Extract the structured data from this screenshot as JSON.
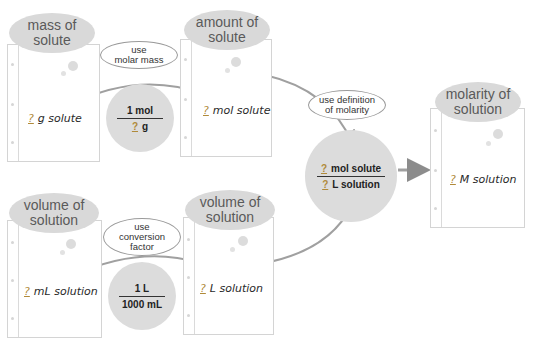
{
  "diagram": {
    "boxes": [
      {
        "id": "mass",
        "label_line1": "mass of",
        "label_line2": "solute",
        "blank": "?",
        "value": "g solute"
      },
      {
        "id": "amount",
        "label_line1": "amount of",
        "label_line2": "solute",
        "blank": "?",
        "value": "mol solute"
      },
      {
        "id": "molarity",
        "label_line1": "molarity of",
        "label_line2": "solution",
        "blank": "?",
        "value": "M solution"
      },
      {
        "id": "volume_ml",
        "label_line1": "volume of",
        "label_line2": "solution",
        "blank": "?",
        "value": "mL solution"
      },
      {
        "id": "volume_l",
        "label_line1": "volume of",
        "label_line2": "solution",
        "blank": "?",
        "value": "L solution"
      }
    ],
    "steps": [
      {
        "id": "molar_mass",
        "line1": "use",
        "line2": "molar mass",
        "line3": ""
      },
      {
        "id": "def_molarity",
        "line1": "use definition",
        "line2": "of molarity",
        "line3": ""
      },
      {
        "id": "conversion",
        "line1": "use",
        "line2": "conversion",
        "line3": "factor"
      }
    ],
    "factors": [
      {
        "id": "molar_mass_factor",
        "numerator": "1 mol",
        "den_blank": "?",
        "denominator": "g"
      },
      {
        "id": "volume_factor",
        "numerator": "1 L",
        "denominator": "1000 mL"
      },
      {
        "id": "molarity_factor",
        "num_blank": "?",
        "numerator": "mol solute",
        "den_blank": "?",
        "denominator": "L solution"
      }
    ],
    "colors": {
      "oval": "#d9d9d9",
      "arrow": "#8c8c8c",
      "circle": "#dcdcdc"
    }
  }
}
